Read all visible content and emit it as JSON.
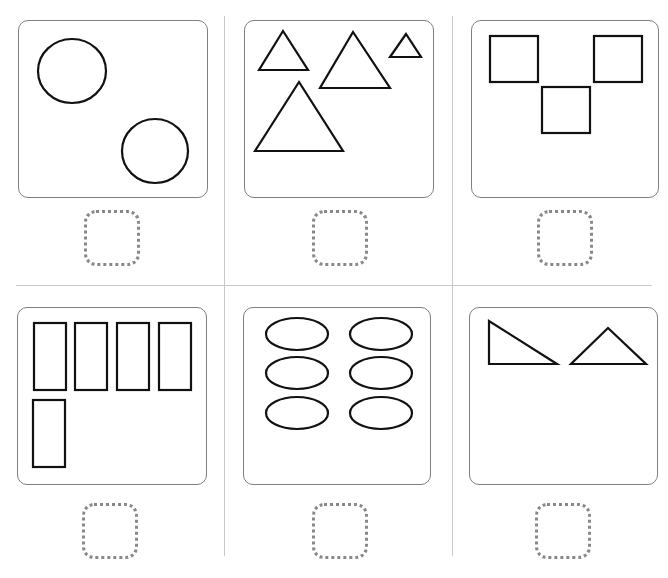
{
  "worksheet": {
    "task": "count shapes and write number in box",
    "colors": {
      "shape_stroke": "#111111",
      "card_border": "#808080",
      "divider": "#c8c8c8",
      "answer_box": "#888888"
    },
    "cells": [
      {
        "shape": "circle",
        "count": 2,
        "answer": ""
      },
      {
        "shape": "triangle",
        "count": 4,
        "answer": ""
      },
      {
        "shape": "square",
        "count": 3,
        "answer": ""
      },
      {
        "shape": "rectangle",
        "count": 5,
        "answer": ""
      },
      {
        "shape": "ellipse",
        "count": 6,
        "answer": ""
      },
      {
        "shape": "triangle",
        "count": 2,
        "answer": ""
      }
    ]
  }
}
